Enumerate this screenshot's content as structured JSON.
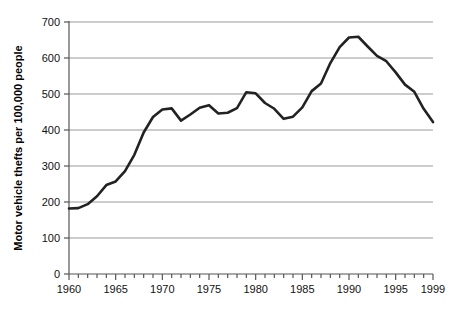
{
  "chart_data": {
    "type": "line",
    "title": "",
    "xlabel": "",
    "ylabel": "Motor vehicle thefts per 100,000 people",
    "xlim": [
      1960,
      1999
    ],
    "ylim": [
      0,
      700
    ],
    "grid": "horizontal",
    "legend": "none",
    "line_color": "#222222",
    "grid_color": "#9a9a9a",
    "axis_color": "#555555",
    "y_ticks": [
      0,
      100,
      200,
      300,
      400,
      500,
      600,
      700
    ],
    "y_tick_labels": [
      "0",
      "100",
      "200",
      "300",
      "400",
      "500",
      "600",
      "700"
    ],
    "x_ticks": [
      1960,
      1961,
      1962,
      1963,
      1964,
      1965,
      1966,
      1967,
      1968,
      1969,
      1970,
      1971,
      1972,
      1973,
      1974,
      1975,
      1976,
      1977,
      1978,
      1979,
      1980,
      1981,
      1982,
      1983,
      1984,
      1985,
      1986,
      1987,
      1988,
      1989,
      1990,
      1991,
      1992,
      1993,
      1994,
      1995,
      1996,
      1997,
      1998,
      1999
    ],
    "x_tick_labels": [
      "1960",
      "1965",
      "1970",
      "1975",
      "1980",
      "1985",
      "1990",
      "1995",
      "1999"
    ],
    "x_labeled_years": [
      1960,
      1965,
      1970,
      1975,
      1980,
      1985,
      1990,
      1995,
      1999
    ],
    "x": [
      1960,
      1961,
      1962,
      1963,
      1964,
      1965,
      1966,
      1967,
      1968,
      1969,
      1970,
      1971,
      1972,
      1973,
      1974,
      1975,
      1976,
      1977,
      1978,
      1979,
      1980,
      1981,
      1982,
      1983,
      1984,
      1985,
      1986,
      1987,
      1988,
      1989,
      1990,
      1991,
      1992,
      1993,
      1994,
      1995,
      1996,
      1997,
      1998,
      1999
    ],
    "values": [
      182,
      183,
      194,
      216,
      247,
      257,
      286,
      331,
      393,
      436,
      457,
      460,
      426,
      443,
      462,
      469,
      446,
      448,
      461,
      505,
      502,
      475,
      459,
      431,
      437,
      463,
      508,
      529,
      586,
      630,
      657,
      659,
      632,
      606,
      591,
      560,
      526,
      506,
      459,
      422
    ],
    "notes": {
      "start_year_value": 182,
      "peak_year": 1991,
      "peak_value": 659,
      "end_year": 1999,
      "end_value": 422
    }
  },
  "figure": {
    "plot_left": 69,
    "plot_right": 433,
    "plot_top": 22,
    "plot_bottom": 274
  }
}
